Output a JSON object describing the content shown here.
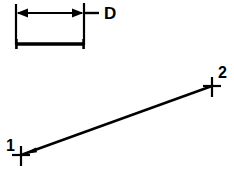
{
  "diagram": {
    "background_color": "#ffffff",
    "stroke_color": "#000000",
    "dimension_block": {
      "label": "D",
      "label_x": 104,
      "label_y": 18,
      "label_font_size": 17,
      "arrow_line": {
        "x1": 16,
        "x2": 84,
        "y": 13
      },
      "leader_line": {
        "x1": 84,
        "x2": 99,
        "y": 13
      },
      "extension_left": {
        "x": 16,
        "y1": 4,
        "y2": 45
      },
      "extension_right": {
        "x": 84,
        "y1": 3,
        "y2": 45
      },
      "base_bar": {
        "x1": 16,
        "x2": 84,
        "y": 44,
        "cap_half_height": 5
      }
    },
    "segment": {
      "line": {
        "x1": 21,
        "y1": 155,
        "x2": 212,
        "y2": 86
      },
      "arrow_at_point1": true,
      "points": [
        {
          "id": "point-1",
          "label": "1",
          "x": 21,
          "y": 155,
          "label_x": 6,
          "label_y": 150,
          "marker": "cross",
          "marker_size": 9
        },
        {
          "id": "point-2",
          "label": "2",
          "x": 212,
          "y": 86,
          "label_x": 218,
          "label_y": 77,
          "marker": "cross",
          "marker_size": 9
        }
      ],
      "label_font_size": 16
    }
  }
}
